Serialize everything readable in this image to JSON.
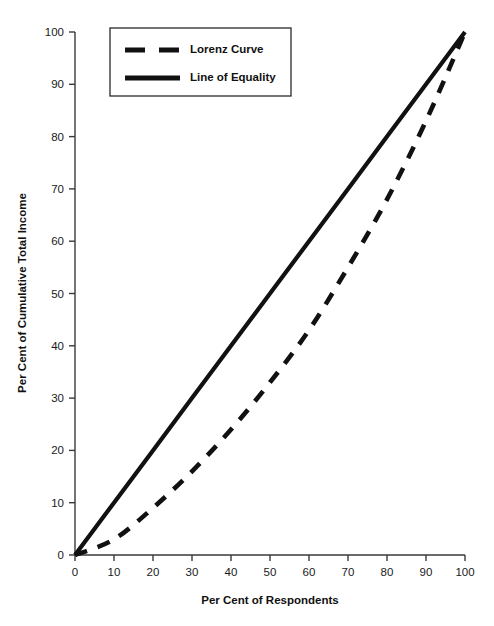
{
  "chart_data": {
    "type": "line",
    "title": "",
    "xlabel": "Per Cent of Respondents",
    "ylabel": "Per Cent of Cumulative Total Income",
    "xlim": [
      0,
      100
    ],
    "ylim": [
      0,
      100
    ],
    "xticks": [
      "0",
      "10",
      "20",
      "30",
      "40",
      "50",
      "60",
      "70",
      "80",
      "90",
      "100"
    ],
    "yticks": [
      "0",
      "10",
      "20",
      "30",
      "40",
      "50",
      "60",
      "70",
      "80",
      "90",
      "100"
    ],
    "grid": false,
    "legend_position": "top-left",
    "x": [
      0,
      10,
      20,
      30,
      40,
      50,
      60,
      70,
      80,
      90,
      100
    ],
    "series": [
      {
        "name": "Lorenz Curve",
        "style": "dashed",
        "color": "#111111",
        "values": [
          0,
          3,
          9,
          16,
          24,
          33,
          43,
          55,
          68,
          83,
          100
        ]
      },
      {
        "name": "Line of Equality",
        "style": "solid",
        "color": "#111111",
        "values": [
          0,
          10,
          20,
          30,
          40,
          50,
          60,
          70,
          80,
          90,
          100
        ]
      }
    ]
  },
  "legend": {
    "entries": [
      {
        "label": "Lorenz Curve",
        "style": "dashed"
      },
      {
        "label": "Line of Equality",
        "style": "solid"
      }
    ]
  },
  "axes": {
    "x_title": "Per Cent of Respondents",
    "y_title": "Per Cent of Cumulative Total Income"
  },
  "colors": {
    "series": "#111111",
    "axis": "#3a3a3a",
    "background": "#ffffff"
  }
}
